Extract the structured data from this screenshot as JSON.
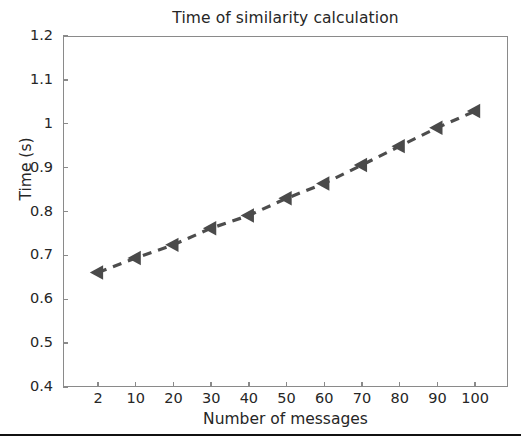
{
  "chart_data": {
    "type": "line",
    "title": "Time of similarity calculation",
    "xlabel": "Number of messages",
    "ylabel": "Time (s)",
    "categories": [
      2,
      10,
      20,
      30,
      40,
      50,
      60,
      70,
      80,
      90,
      100
    ],
    "x_tick_labels": [
      "2",
      "10",
      "20",
      "30",
      "40",
      "50",
      "60",
      "70",
      "80",
      "90",
      "100"
    ],
    "values": [
      0.661,
      0.694,
      0.724,
      0.762,
      0.791,
      0.83,
      0.864,
      0.906,
      0.949,
      0.991,
      1.029
    ],
    "y_tick_labels": [
      "0.4",
      "0.5",
      "0.6",
      "0.7",
      "0.8",
      "0.9",
      "1",
      "1.1",
      "1.2"
    ],
    "y_tick_values": [
      0.4,
      0.5,
      0.6,
      0.7,
      0.8,
      0.9,
      1.0,
      1.1,
      1.2
    ],
    "ylim": [
      0.4,
      1.2
    ],
    "grid": false,
    "legend": false,
    "series": [
      {
        "name": "similarity calculation time",
        "values": [
          0.661,
          0.694,
          0.724,
          0.762,
          0.791,
          0.83,
          0.864,
          0.906,
          0.949,
          0.991,
          1.029
        ],
        "line_style": "dashed",
        "marker": "triangle-left",
        "color": "#4d4d4d"
      }
    ],
    "colors": {
      "series_line": "#4d4d4d",
      "marker": "#4a4a4a",
      "axis": "#8a8a8a",
      "text": "#262626",
      "background": "#ffffff",
      "rule": "#111111"
    }
  }
}
